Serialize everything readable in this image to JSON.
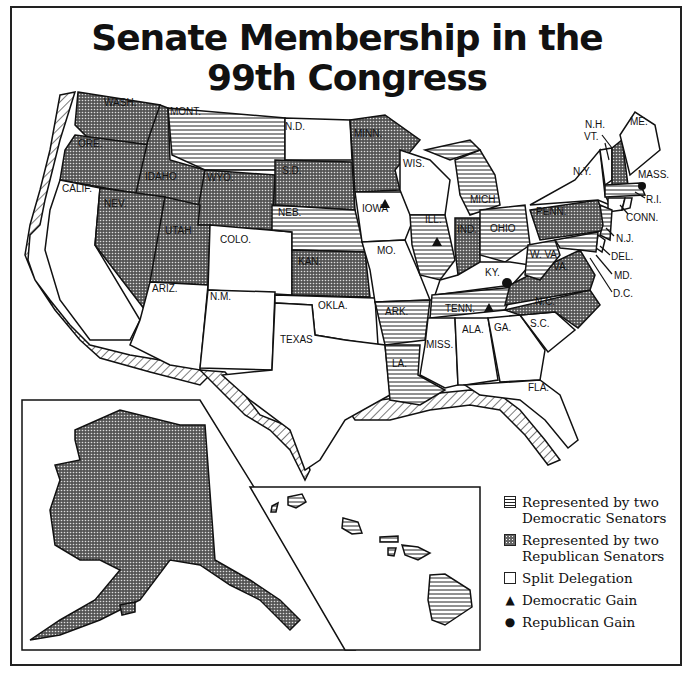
{
  "title": {
    "line1": "Senate Membership in the",
    "line2": "99th Congress"
  },
  "legend": {
    "items": [
      {
        "key": "dem",
        "label_line1": "Represented by two",
        "label_line2": "Democratic Senators"
      },
      {
        "key": "rep",
        "label_line1": "Represented by two",
        "label_line2": "Republican Senators"
      },
      {
        "key": "split",
        "label_line1": "Split Delegation",
        "label_line2": ""
      },
      {
        "key": "dem_gain",
        "label_line1": "Democratic Gain",
        "label_line2": ""
      },
      {
        "key": "rep_gain",
        "label_line1": "Republican Gain",
        "label_line2": ""
      }
    ]
  },
  "states": {
    "wash": {
      "label": "WASH.",
      "status": "rep"
    },
    "ore": {
      "label": "ORE.",
      "status": "rep"
    },
    "calif": {
      "label": "CALIF.",
      "status": "split"
    },
    "idaho": {
      "label": "IDAHO",
      "status": "rep"
    },
    "nev": {
      "label": "NEV.",
      "status": "rep"
    },
    "mont": {
      "label": "MONT.",
      "status": "dem"
    },
    "wyo": {
      "label": "WYO.",
      "status": "rep"
    },
    "utah": {
      "label": "UTAH",
      "status": "rep"
    },
    "ariz": {
      "label": "ARIZ.",
      "status": "split"
    },
    "colo": {
      "label": "COLO.",
      "status": "split"
    },
    "nm": {
      "label": "N.M.",
      "status": "split"
    },
    "nd": {
      "label": "N.D.",
      "status": "split"
    },
    "sd": {
      "label": "S.D.",
      "status": "rep"
    },
    "neb": {
      "label": "NEB.",
      "status": "dem"
    },
    "kan": {
      "label": "KAN.",
      "status": "rep"
    },
    "okla": {
      "label": "OKLA.",
      "status": "split"
    },
    "texas": {
      "label": "TEXAS",
      "status": "split"
    },
    "minn": {
      "label": "MINN.",
      "status": "rep"
    },
    "iowa": {
      "label": "IOWA",
      "status": "split",
      "gain": "dem"
    },
    "mo": {
      "label": "MO.",
      "status": "split"
    },
    "ark": {
      "label": "ARK.",
      "status": "dem"
    },
    "la": {
      "label": "LA.",
      "status": "dem"
    },
    "wis": {
      "label": "WIS.",
      "status": "split"
    },
    "ill": {
      "label": "ILL.",
      "status": "dem",
      "gain": "dem"
    },
    "mich": {
      "label": "MICH",
      "status": "dem"
    },
    "ind": {
      "label": "IND.",
      "status": "rep"
    },
    "ohio": {
      "label": "OHIO",
      "status": "dem"
    },
    "ky": {
      "label": "KY.",
      "status": "split",
      "gain": "rep"
    },
    "tenn": {
      "label": "TENN.",
      "status": "dem",
      "gain": "dem"
    },
    "miss": {
      "label": "MISS.",
      "status": "split"
    },
    "ala": {
      "label": "ALA.",
      "status": "split"
    },
    "ga": {
      "label": "GA.",
      "status": "split"
    },
    "fla": {
      "label": "FLA.",
      "status": "split"
    },
    "sc": {
      "label": "S.C.",
      "status": "split"
    },
    "nc": {
      "label": "N.C.",
      "status": "rep"
    },
    "va": {
      "label": "VA.",
      "status": "rep"
    },
    "wva": {
      "label": "W. VA.",
      "status": "dem"
    },
    "penn": {
      "label": "PENN.",
      "status": "rep"
    },
    "ny": {
      "label": "N.Y.",
      "status": "split"
    },
    "vt": {
      "label": "VT.",
      "status": "split"
    },
    "nh": {
      "label": "N.H.",
      "status": "rep"
    },
    "me": {
      "label": "ME.",
      "status": "split"
    },
    "mass": {
      "label": "MASS.",
      "status": "dem",
      "gain": "rep"
    },
    "ri": {
      "label": "R.I.",
      "status": "split"
    },
    "conn": {
      "label": "CONN.",
      "status": "split"
    },
    "nj": {
      "label": "N.J.",
      "status": "dem"
    },
    "del": {
      "label": "DEL.",
      "status": "split"
    },
    "md": {
      "label": "MD.",
      "status": "dem"
    },
    "dc": {
      "label": "D.C.",
      "status": "none"
    },
    "alaska": {
      "label": "ALASKA",
      "status": "rep"
    },
    "hawaii": {
      "label": "HAWAII",
      "status": "dem"
    }
  },
  "colors": {
    "ink": "#111111",
    "paper": "#ffffff",
    "rep_fill": "#777777"
  }
}
